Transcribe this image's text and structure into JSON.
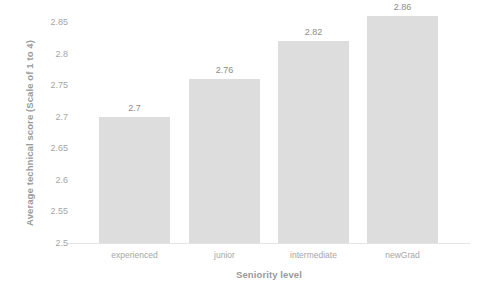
{
  "chart_data": {
    "type": "bar",
    "title": "",
    "categories": [
      "experienced",
      "junior",
      "intermediate",
      "newGrad"
    ],
    "values": [
      2.7,
      2.76,
      2.82,
      2.86
    ],
    "value_labels": [
      "2.7",
      "2.76",
      "2.82",
      "2.86"
    ],
    "xlabel": "Seniority level",
    "ylabel": "Average technical score (Scale of 1 to 4)",
    "ylim": [
      2.5,
      2.85
    ],
    "ytick_labels": [
      "2.85",
      "2.8",
      "2.75",
      "2.7",
      "2.65",
      "2.6",
      "2.55",
      "2.5"
    ],
    "ytick_values": [
      2.85,
      2.8,
      2.75,
      2.7,
      2.65,
      2.6,
      2.55,
      2.5
    ],
    "grid": false,
    "legend": false,
    "legend_position": "none",
    "bar_color": "#dddddd",
    "axis_line_color": "#e4e4e4",
    "label_color": "#a6a6a6",
    "title_color": "#9a9a9a"
  }
}
